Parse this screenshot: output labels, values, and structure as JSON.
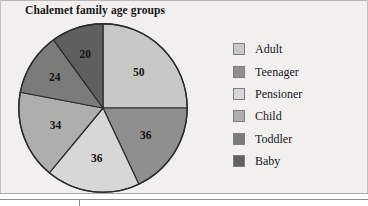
{
  "chart_data": {
    "type": "pie",
    "title": "Chalemet family age groups",
    "xlabel": "",
    "ylabel": "",
    "legend_position": "right",
    "grid": false,
    "total": 200,
    "categories": [
      "Adult",
      "Teenager",
      "Pensioner",
      "Child",
      "Toddler",
      "Baby"
    ],
    "values": [
      50,
      36,
      36,
      34,
      24,
      20
    ],
    "slices": [
      {
        "label": "Adult",
        "value": 50,
        "value_text": "50",
        "color": "#c8c8c6",
        "start_deg": 0,
        "end_deg": 90
      },
      {
        "label": "Teenager",
        "value": 36,
        "value_text": "36",
        "color": "#8f8f8d",
        "start_deg": 90,
        "end_deg": 154.8
      },
      {
        "label": "Pensioner",
        "value": 36,
        "value_text": "36",
        "color": "#d7d7d5",
        "start_deg": 154.8,
        "end_deg": 219.6
      },
      {
        "label": "Child",
        "value": 34,
        "value_text": "34",
        "color": "#aeaeac",
        "start_deg": 219.6,
        "end_deg": 280.8
      },
      {
        "label": "Toddler",
        "value": 24,
        "value_text": "24",
        "color": "#7b7b79",
        "start_deg": 280.8,
        "end_deg": 324
      },
      {
        "label": "Baby",
        "value": 20,
        "value_text": "20",
        "color": "#5f5f5d",
        "start_deg": 324,
        "end_deg": 360
      }
    ]
  },
  "legend": {
    "items": [
      {
        "label": "Adult",
        "color": "#c8c8c6"
      },
      {
        "label": "Teenager",
        "color": "#8f8f8d"
      },
      {
        "label": "Pensioner",
        "color": "#d7d7d5"
      },
      {
        "label": "Child",
        "color": "#aeaeac"
      },
      {
        "label": "Toddler",
        "color": "#7b7b79"
      },
      {
        "label": "Baby",
        "color": "#5f5f5d"
      }
    ]
  },
  "colors": {
    "background": "#f1f0ee",
    "outline": "#2c2c2c",
    "text": "#16161a"
  }
}
